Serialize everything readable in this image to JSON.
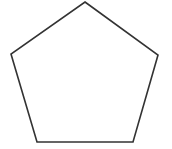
{
  "canvas": {
    "width": 172,
    "height": 149,
    "background_color": "#ffffff",
    "alt_text": "Pentagon"
  },
  "figure": {
    "name": "pentagon",
    "shape_type": "polygon",
    "sides": 5,
    "fill_color": "none",
    "stroke_color": "#333333",
    "stroke_width": 1.6,
    "closed": true,
    "vertex_count": 5,
    "vertices": [
      {
        "label": "apex",
        "x": 85,
        "y": 2
      },
      {
        "label": "right",
        "x": 158,
        "y": 55
      },
      {
        "label": "bottom-right",
        "x": 133,
        "y": 142
      },
      {
        "label": "bottom-left",
        "x": 37,
        "y": 142
      },
      {
        "label": "left",
        "x": 11,
        "y": 54
      }
    ],
    "points_attr": "85,2 158,55 133,142 37,142 11,54"
  }
}
